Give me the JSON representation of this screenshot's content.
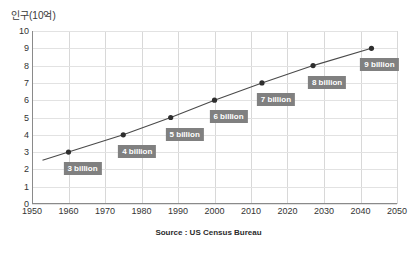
{
  "chart_data": {
    "type": "line",
    "title": "",
    "subtitle": "",
    "ylabel": "인구(10억)",
    "xlabel": "",
    "xlim": [
      1950,
      2050
    ],
    "ylim": [
      0,
      10
    ],
    "grid": true,
    "legend_position": "none",
    "x_ticks": [
      1950,
      1960,
      1970,
      1980,
      1990,
      2000,
      2010,
      2020,
      2030,
      2040,
      2050
    ],
    "y_ticks": [
      0,
      1,
      2,
      3,
      4,
      5,
      6,
      7,
      8,
      9,
      10
    ],
    "series": [
      {
        "name": "World population",
        "x": [
          1960,
          1975,
          1988,
          2000,
          2013,
          2027,
          2043
        ],
        "values": [
          3,
          4,
          5,
          6,
          7,
          8,
          9
        ],
        "line_color": "#4a4a4a",
        "marker_color": "#2e2e2e"
      }
    ],
    "annotations": [
      {
        "label": "3 billion",
        "x": 1960,
        "y": 3,
        "dx": 14,
        "dy": 16
      },
      {
        "label": "4 billion",
        "x": 1975,
        "y": 4,
        "dx": 14,
        "dy": 16
      },
      {
        "label": "5 billion",
        "x": 1988,
        "y": 5,
        "dx": 14,
        "dy": 16
      },
      {
        "label": "6 billion",
        "x": 2000,
        "y": 6,
        "dx": 14,
        "dy": 16
      },
      {
        "label": "7 billion",
        "x": 2013,
        "y": 7,
        "dx": 14,
        "dy": 16
      },
      {
        "label": "8 billion",
        "x": 2027,
        "y": 8,
        "dx": 14,
        "dy": 16
      },
      {
        "label": "9 billion",
        "x": 2043,
        "y": 9,
        "dx": 8,
        "dy": 16
      }
    ],
    "source": "Source : US Census Bureau",
    "colors": {
      "background": "#ffffff",
      "grid": "#dcdcdc",
      "axis": "#8a8a8a",
      "label_box": "#808080",
      "label_text": "#ffffff",
      "tick_text": "#333333"
    }
  }
}
